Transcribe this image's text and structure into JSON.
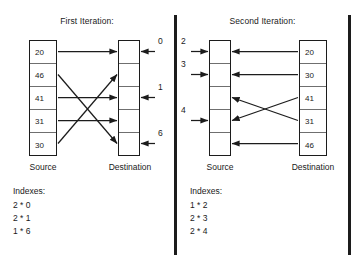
{
  "figure": {
    "background": "#ffffff",
    "ink": "#1c1c1c"
  },
  "panels": [
    {
      "id": "first-iteration",
      "title": "First Iteration:",
      "source": {
        "caption": "Source",
        "values": [
          "20",
          "46",
          "41",
          "31",
          "30"
        ]
      },
      "destination": {
        "caption": "Destination",
        "values": [
          "",
          "",
          "",
          "",
          ""
        ]
      },
      "outer_labels": [
        {
          "text": "0",
          "row": 1
        },
        {
          "text": "1",
          "row": 3
        },
        {
          "text": "6",
          "row": 5
        }
      ],
      "indexes": {
        "title": "Indexes:",
        "rows": [
          "2 * 0",
          "2 * 1",
          "1 * 6"
        ]
      },
      "mapping": [
        {
          "from": 1,
          "to": 1
        },
        {
          "from": 2,
          "to": 5
        },
        {
          "from": 3,
          "to": 3
        },
        {
          "from": 4,
          "to": 4
        },
        {
          "from": 5,
          "to": 2
        }
      ]
    },
    {
      "id": "second-iteration",
      "title": "Second Iteration:",
      "source": {
        "caption": "Source",
        "values": [
          "",
          "",
          "",
          "",
          ""
        ]
      },
      "destination": {
        "caption": "Destination",
        "values": [
          "20",
          "30",
          "41",
          "31",
          "46"
        ]
      },
      "outer_labels": [
        {
          "text": "2",
          "row": 1
        },
        {
          "text": "3",
          "row": 2
        },
        {
          "text": "4",
          "row": 4
        }
      ],
      "indexes": {
        "title": "Indexes:",
        "rows": [
          "1 * 2",
          "2 * 3",
          "2 * 4"
        ]
      },
      "mapping": [
        {
          "from": 1,
          "to": 1
        },
        {
          "from": 2,
          "to": 2
        },
        {
          "from": 3,
          "to": 4
        },
        {
          "from": 4,
          "to": 3
        },
        {
          "from": 5,
          "to": 5
        }
      ]
    }
  ]
}
